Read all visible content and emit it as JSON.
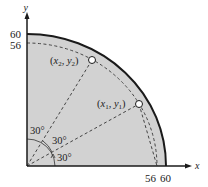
{
  "diagram": {
    "type": "quarter-circle region with sprinkler coverage",
    "colors": {
      "region_fill": "#d2d2d2",
      "outline": "#1a1a1a",
      "dashed": "#444444",
      "point_fill": "#ffffff"
    },
    "axes": {
      "x_label": "x",
      "y_label": "y",
      "x_ticks": [
        "56",
        "60"
      ],
      "y_ticks": [
        "60",
        "56"
      ]
    },
    "outer_radius": 60,
    "inner_radius": 56,
    "points": [
      {
        "id": "p1",
        "label_x": "x",
        "sub": "1",
        "label_y": "y",
        "text": "(x1, y1)",
        "angle_deg": 30
      },
      {
        "id": "p2",
        "label_x": "x",
        "sub": "2",
        "label_y": "y",
        "text": "(x2, y2)",
        "angle_deg": 60
      }
    ],
    "angles": [
      "30°",
      "30°",
      "30°"
    ]
  }
}
